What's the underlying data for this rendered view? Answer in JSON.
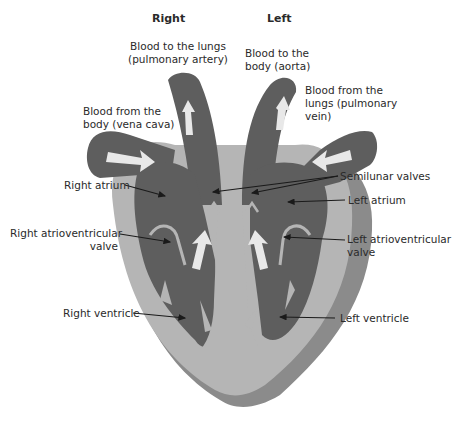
{
  "diagram": {
    "type": "labeled cross-section of the human heart",
    "headers": {
      "right": "Right",
      "left": "Left"
    },
    "labels": {
      "pulmonary_artery": [
        "Blood to the lungs",
        "(pulmonary artery)"
      ],
      "aorta": [
        "Blood to the",
        "body (aorta)"
      ],
      "pulmonary_vein": [
        "Blood from the",
        "lungs (pulmonary",
        "vein)"
      ],
      "vena_cava": [
        "Blood from the",
        "body (vena cava)"
      ],
      "right_atrium": "Right atrium",
      "semilunar_valves": "Semilunar valves",
      "left_atrium": "Left atrium",
      "right_av_valve": [
        "Right atrioventricular",
        "valve"
      ],
      "left_av_valve": [
        "Left atrioventricular",
        "valve"
      ],
      "right_ventricle": "Right ventricle",
      "left_ventricle": "Left ventricle"
    },
    "colors": {
      "chamber": "#5e5e5e",
      "wall": "#b5b5b5",
      "outer_shell": "#8b8b8b",
      "arrow": "#e8e8e8",
      "leader_line": "#1a1a1a"
    }
  }
}
